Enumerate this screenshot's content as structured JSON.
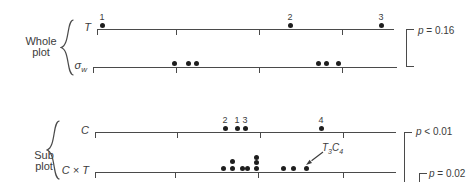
{
  "chart_data": {
    "type": "scatter",
    "title": "",
    "groups": [
      {
        "label": "Whole plot"
      },
      {
        "label": "Sub plot"
      }
    ],
    "rows": [
      {
        "group": "Whole plot",
        "label_main": "T",
        "label_sub": "",
        "axis_y": 29,
        "x_start": 97,
        "x_end": 394,
        "ticks": [
          97,
          176,
          259,
          342
        ],
        "points": [
          {
            "x": 102,
            "y": 25,
            "label": "1"
          },
          {
            "x": 290,
            "y": 25,
            "label": "2"
          },
          {
            "x": 381,
            "y": 25,
            "label": "3"
          }
        ]
      },
      {
        "group": "Whole plot",
        "label_main": "σ",
        "label_sub": "w",
        "axis_y": 67,
        "x_start": 93,
        "x_end": 397,
        "ticks": [
          93,
          176,
          259,
          342
        ],
        "points": [
          {
            "x": 174,
            "y": 63
          },
          {
            "x": 188,
            "y": 63
          },
          {
            "x": 196,
            "y": 63
          },
          {
            "x": 318,
            "y": 63
          },
          {
            "x": 326,
            "y": 63
          },
          {
            "x": 338,
            "y": 63
          }
        ]
      },
      {
        "group": "Sub plot",
        "label_main": "C",
        "label_sub": "",
        "axis_y": 132,
        "x_start": 95,
        "x_end": 396,
        "ticks": [
          95,
          177,
          260,
          343
        ],
        "points": [
          {
            "x": 225,
            "y": 128,
            "label": "2"
          },
          {
            "x": 237,
            "y": 128,
            "label": "1"
          },
          {
            "x": 245,
            "y": 128,
            "label": "3"
          },
          {
            "x": 321,
            "y": 128,
            "label": "4"
          }
        ]
      },
      {
        "group": "Sub plot",
        "label_main": "C × T",
        "label_sub": "",
        "axis_y": 172,
        "x_start": 95,
        "x_end": 396,
        "ticks": [
          95,
          175,
          258,
          343
        ],
        "points": [
          {
            "x": 223,
            "y": 168
          },
          {
            "x": 232,
            "y": 161
          },
          {
            "x": 232,
            "y": 168
          },
          {
            "x": 242,
            "y": 168
          },
          {
            "x": 247,
            "y": 168
          },
          {
            "x": 256,
            "y": 157
          },
          {
            "x": 256,
            "y": 162
          },
          {
            "x": 256,
            "y": 168
          },
          {
            "x": 283,
            "y": 168
          },
          {
            "x": 293,
            "y": 168
          },
          {
            "x": 306,
            "y": 168
          }
        ]
      }
    ],
    "brackets": [
      {
        "x": 406,
        "y_top": 29,
        "y_bottom": 66,
        "arm": 8,
        "closed_bottom": true,
        "label_var": "p",
        "label_rest": "= 0.16",
        "label_x": 418,
        "label_y": 31
      },
      {
        "x": 404,
        "y_top": 132,
        "y_bottom": 183,
        "arm": 8,
        "closed_bottom": false,
        "label_var": "p",
        "label_rest": "< 0.01",
        "label_x": 416,
        "label_y": 132
      },
      {
        "x": 419,
        "y_top": 173,
        "y_bottom": 183,
        "arm": 8,
        "closed_bottom": false,
        "label_var": "p",
        "label_rest": "= 0.02",
        "label_x": 429,
        "label_y": 174
      }
    ],
    "annotation": {
      "parts": [
        {
          "main": "T",
          "sub": "3"
        },
        {
          "main": "C",
          "sub": "4"
        }
      ],
      "target_x": 306,
      "target_y": 168
    },
    "colors": {
      "line": "#4a4a4a",
      "dot": "#1e1e1e",
      "text": "#3c3c3c"
    }
  }
}
